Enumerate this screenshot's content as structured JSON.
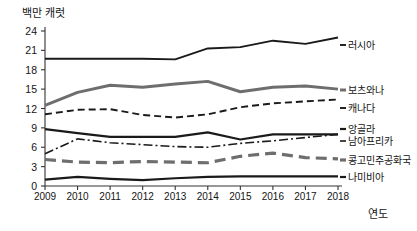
{
  "chart_data": {
    "type": "line",
    "title": "",
    "ylabel": "백만 캐럿",
    "xlabel": "연도",
    "categories": [
      "2009",
      "2010",
      "2011",
      "2012",
      "2013",
      "2014",
      "2015",
      "2016",
      "2017",
      "2018"
    ],
    "x": [
      2009,
      2010,
      2011,
      2012,
      2013,
      2014,
      2015,
      2016,
      2017,
      2018
    ],
    "ylim": [
      0,
      24
    ],
    "yticks": [
      0,
      3,
      6,
      9,
      12,
      15,
      18,
      21,
      24
    ],
    "grid": false,
    "legend_position": "right",
    "series": [
      {
        "name": "러시아",
        "values": [
          19.7,
          19.7,
          19.7,
          19.7,
          19.6,
          21.3,
          21.5,
          22.5,
          22.0,
          23.0
        ],
        "style": "solid",
        "color": "#1a1a1a",
        "width": 1.9
      },
      {
        "name": "보츠와나",
        "values": [
          12.5,
          14.5,
          15.6,
          15.3,
          15.8,
          16.2,
          14.6,
          15.3,
          15.5,
          15.0
        ],
        "style": "solid",
        "color": "#6e6e6e",
        "width": 3.0
      },
      {
        "name": "캐나다",
        "values": [
          11.1,
          11.8,
          11.9,
          11.0,
          10.6,
          11.1,
          12.2,
          12.8,
          13.1,
          13.4
        ],
        "style": "dashed",
        "color": "#1a1a1a",
        "width": 1.9
      },
      {
        "name": "앙골라",
        "values": [
          8.8,
          8.2,
          7.6,
          7.6,
          7.6,
          8.3,
          7.2,
          8.0,
          8.0,
          8.0
        ],
        "style": "solid",
        "color": "#1a1a1a",
        "width": 2.2
      },
      {
        "name": "남아프리카",
        "values": [
          5.0,
          7.3,
          6.7,
          6.4,
          6.1,
          6.0,
          6.6,
          7.0,
          7.5,
          8.0
        ],
        "style": "dashdot",
        "color": "#1a1a1a",
        "width": 1.6
      },
      {
        "name": "콩고민주공화국",
        "values": [
          4.1,
          3.7,
          3.6,
          3.8,
          3.7,
          3.6,
          4.6,
          5.1,
          4.4,
          4.2
        ],
        "style": "longdash",
        "color": "#6e6e6e",
        "width": 3.2
      },
      {
        "name": "나미비아",
        "values": [
          1.0,
          1.4,
          1.1,
          0.9,
          1.2,
          1.4,
          1.5,
          1.5,
          1.5,
          1.5
        ],
        "style": "solid",
        "color": "#1a1a1a",
        "width": 2.2
      }
    ]
  },
  "axis": {
    "ylabel": "백만 캐럿",
    "xlabel": "연도",
    "yticks": [
      "0",
      "3",
      "6",
      "9",
      "12",
      "15",
      "18",
      "21",
      "24"
    ],
    "xticks": [
      "2009",
      "2010",
      "2011",
      "2012",
      "2013",
      "2014",
      "2015",
      "2016",
      "2017",
      "2018"
    ]
  },
  "legend": {
    "items": [
      {
        "label": "러시아"
      },
      {
        "label": "보츠와나"
      },
      {
        "label": "캐나다"
      },
      {
        "label": "앙골라"
      },
      {
        "label": "남아프리카"
      },
      {
        "label": "콩고민주공화국"
      },
      {
        "label": "나미비아"
      }
    ]
  },
  "colors": {
    "dark": "#1a1a1a",
    "gray": "#6e6e6e",
    "axis": "#333333",
    "background": "#ffffff"
  }
}
